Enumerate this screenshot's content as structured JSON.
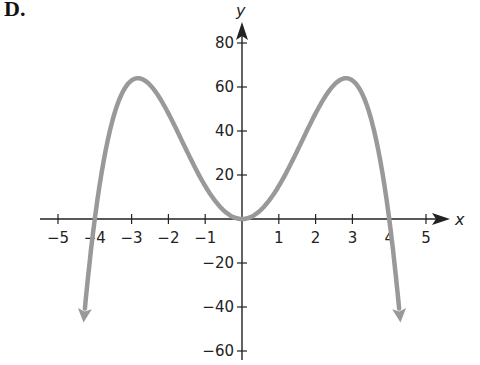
{
  "figure_label": "D.",
  "chart_data": {
    "type": "line",
    "title": "",
    "xlabel": "x",
    "ylabel": "y",
    "equation_implied": "y = -x^4 + 16x^2",
    "xlim": [
      -5.3,
      5.5
    ],
    "ylim": [
      -64,
      86
    ],
    "x_ticks": [
      -5,
      -4,
      -3,
      -2,
      -1,
      1,
      2,
      3,
      4,
      5
    ],
    "x_tick_labels": [
      "−5",
      "−4",
      "−3",
      "−2",
      "−1",
      "1",
      "2",
      "3",
      "4",
      "5"
    ],
    "y_ticks": [
      -60,
      -40,
      -20,
      20,
      40,
      60,
      80
    ],
    "y_tick_labels": [
      "−60",
      "−40",
      "−20",
      "20",
      "40",
      "60",
      "80"
    ],
    "grid": false,
    "series": [
      {
        "name": "curve",
        "color": "#999999",
        "points": [
          [
            -4.3,
            -56
          ],
          [
            -4.0,
            0
          ],
          [
            -3.5,
            46
          ],
          [
            -2.83,
            64
          ],
          [
            -2.0,
            48
          ],
          [
            -1.0,
            15
          ],
          [
            0,
            0
          ],
          [
            1.0,
            15
          ],
          [
            2.0,
            48
          ],
          [
            2.83,
            64
          ],
          [
            3.5,
            46
          ],
          [
            4.0,
            0
          ],
          [
            4.3,
            -56
          ]
        ],
        "x_intercepts": [
          -4,
          0,
          4
        ],
        "local_maxima": [
          [
            -2.83,
            64
          ],
          [
            2.83,
            64
          ]
        ],
        "local_minimum": [
          0,
          0
        ],
        "end_behavior": "both ends down (arrows)"
      }
    ]
  },
  "colors": {
    "axis": "#222222",
    "curve": "#999999",
    "background": "#ffffff"
  }
}
